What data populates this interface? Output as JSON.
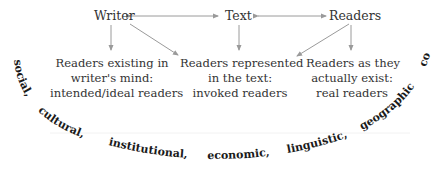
{
  "diagram": {
    "top_nodes": {
      "writer": "Writer",
      "text": "Text",
      "readers": "Readers"
    },
    "blocks": {
      "left": [
        "Readers existing in",
        "writer's mind:",
        "intended/ideal readers"
      ],
      "middle": [
        "Readers represented",
        "in the text:",
        "invoked readers"
      ],
      "right": [
        "Readers as they",
        "actually exist:",
        "real readers"
      ]
    },
    "context_arc": {
      "words": [
        "social,",
        "cultural,",
        "institutional,",
        "economic,",
        "linguistic,",
        "geographic",
        "contexts"
      ]
    },
    "edges": [
      {
        "from": "Writer",
        "to": "Text",
        "type": "bidirectional"
      },
      {
        "from": "Text",
        "to": "Readers",
        "type": "bidirectional"
      },
      {
        "from": "Writer",
        "to": "Readers existing in writer's mind",
        "type": "directed"
      },
      {
        "from": "Writer",
        "to": "Readers represented in the text",
        "type": "directed"
      },
      {
        "from": "Text",
        "to": "Readers represented in the text",
        "type": "directed"
      },
      {
        "from": "Readers",
        "to": "Readers represented in the text",
        "type": "directed"
      },
      {
        "from": "Readers",
        "to": "Readers as they actually exist",
        "type": "directed"
      }
    ],
    "colors": {
      "text": "#333333",
      "arrow": "#9a9a9a",
      "arc_text": "#1a1a1a"
    }
  }
}
